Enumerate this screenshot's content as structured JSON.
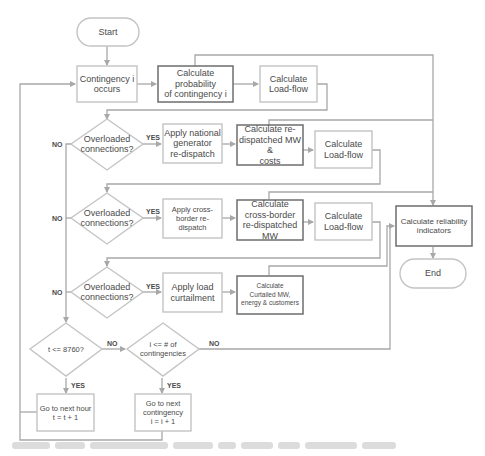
{
  "diagram": {
    "type": "flowchart",
    "terminals": {
      "start": "Start",
      "end": "End"
    },
    "nodes": {
      "contingency_occurs": "Contingency i\noccurs",
      "calc_probability": "Calculate probability\nof contingency i",
      "calc_loadflow_1": "Calculate\nLoad-flow",
      "overloaded_1": "Overloaded\nconnections?",
      "apply_national": "Apply national\ngenerator\nre-dispatch",
      "calc_redispatched": "Calculate re-\ndispatched MW &\ncosts",
      "calc_loadflow_2": "Calculate\nLoad-flow",
      "overloaded_2": "Overloaded\nconnections?",
      "apply_crossborder": "Apply cross-\nborder re-dispatch",
      "calc_crossborder": "Calculate\ncross-border\nre-dispatched MW",
      "calc_loadflow_3": "Calculate\nLoad-flow",
      "calc_reliability": "Calculate reliability\nindicators",
      "overloaded_3": "Overloaded\nconnections?",
      "apply_curtailment": "Apply load\ncurtailment",
      "calc_curtailed": "Calculate\nCurtailed MW,\nenergy & customers",
      "t_check": "t <= 8760?",
      "i_check": "i <= # of\ncontingencies",
      "next_hour": "Go to next hour\nt = t + 1",
      "next_contingency": "Go to next\ncontingency\ni = i + 1"
    },
    "edge_labels": {
      "yes": "YES",
      "no": "NO"
    },
    "colors": {
      "line": "#a8a8a8",
      "box_border_light": "#c4c4c4",
      "box_border_dark": "#6e6e6e",
      "text": "#4a4a4a"
    }
  }
}
